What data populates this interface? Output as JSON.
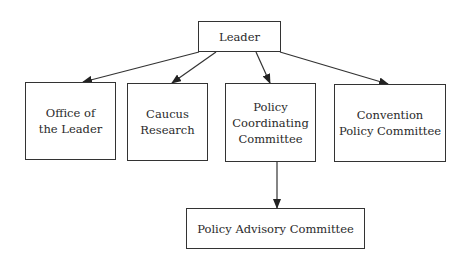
{
  "diagram": {
    "type": "org-chart",
    "nodes": [
      {
        "id": "leader",
        "label": "Leader"
      },
      {
        "id": "office",
        "label": "Office of\nthe Leader"
      },
      {
        "id": "caucus",
        "label": "Caucus\nResearch"
      },
      {
        "id": "pcc",
        "label": "Policy\nCoordinating\nCommittee"
      },
      {
        "id": "cpc",
        "label": "Convention\nPolicy Committee"
      },
      {
        "id": "pac",
        "label": "Policy Advisory Committee"
      }
    ],
    "edges": [
      {
        "from": "leader",
        "to": "office"
      },
      {
        "from": "leader",
        "to": "caucus"
      },
      {
        "from": "leader",
        "to": "pcc"
      },
      {
        "from": "leader",
        "to": "cpc"
      },
      {
        "from": "pcc",
        "to": "pac"
      }
    ]
  }
}
